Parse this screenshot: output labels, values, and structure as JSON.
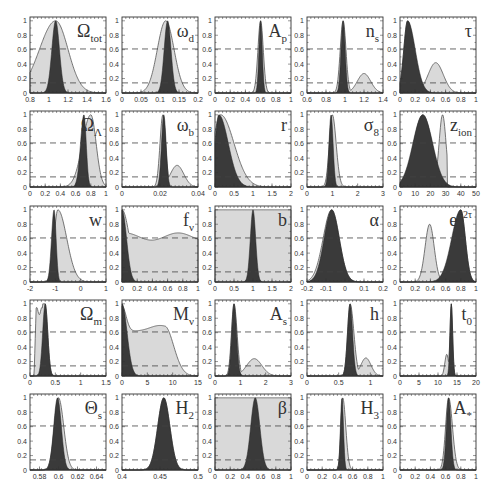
{
  "figure": {
    "type": "grid of 1D marginal likelihood panels",
    "rows": 5,
    "cols": 5,
    "colors": {
      "background": "#ffffff",
      "light_fill": "#d9d9d9",
      "dark_fill": "#3a3a3a",
      "line": "#555555",
      "dashed": "#444444",
      "axis": "#333333"
    },
    "dashed_levels": [
      0.61,
      0.14
    ],
    "yticks": [
      "0",
      "0.2",
      "0.4",
      "0.6",
      "0.8",
      "1"
    ]
  },
  "chart_data": [
    {
      "id": "omega_tot",
      "label": "Ω",
      "sub": "tot",
      "sup": "",
      "xlim": [
        0.5,
        1.6
      ],
      "xticks": [
        {
          "v": 0.5,
          "t": "0.8"
        },
        {
          "v": 0.8,
          "t": "1"
        },
        {
          "v": 1.0,
          "t": "1.2"
        },
        {
          "v": 1.2,
          "t": "1.4"
        },
        {
          "v": 1.4,
          "t": "1.6"
        }
      ],
      "xticks_real": [
        {
          "v": 0.8,
          "t": "0.8"
        },
        {
          "v": 1.0,
          "t": "1"
        },
        {
          "v": 1.2,
          "t": "1.2"
        },
        {
          "v": 1.4,
          "t": "1.4"
        },
        {
          "v": 1.6,
          "t": "1.6"
        }
      ],
      "xlim_real": [
        0.8,
        1.6
      ],
      "light": {
        "peak": 1.07,
        "sl": 0.17,
        "sr": 0.13
      },
      "dark": {
        "peak": 1.07,
        "sl": 0.04,
        "sr": 0.04
      },
      "light_floor_left": 0.32,
      "type": "line"
    },
    {
      "id": "omega_d",
      "label": "ω",
      "sub": "d",
      "sup": "",
      "xlim_real": [
        0,
        0.2
      ],
      "xticks_real": [
        {
          "v": 0,
          "t": "0"
        },
        {
          "v": 0.05,
          "t": "0.05"
        },
        {
          "v": 0.1,
          "t": "0.1"
        },
        {
          "v": 0.15,
          "t": "0.15"
        },
        {
          "v": 0.2,
          "t": "0.2"
        }
      ],
      "light": {
        "peak": 0.115,
        "sl": 0.022,
        "sr": 0.022
      },
      "dark": {
        "peak": 0.12,
        "sl": 0.009,
        "sr": 0.009
      },
      "type": "line"
    },
    {
      "id": "A_p",
      "label": "A",
      "sub": "p",
      "sup": "",
      "xlim_real": [
        0,
        1
      ],
      "xticks_real": [
        {
          "v": 0,
          "t": "0"
        },
        {
          "v": 0.2,
          "t": "0.2"
        },
        {
          "v": 0.4,
          "t": "0.4"
        },
        {
          "v": 0.6,
          "t": "0.6"
        },
        {
          "v": 0.8,
          "t": "0.8"
        },
        {
          "v": 1,
          "t": "1"
        }
      ],
      "light": {
        "peak": 0.6,
        "sl": 0.035,
        "sr": 0.035
      },
      "dark": {
        "peak": 0.6,
        "sl": 0.022,
        "sr": 0.022
      },
      "type": "line"
    },
    {
      "id": "n_s",
      "label": "n",
      "sub": "s",
      "sup": "",
      "xlim_real": [
        0.6,
        1.4
      ],
      "xticks_real": [
        {
          "v": 0.6,
          "t": "0.6"
        },
        {
          "v": 0.8,
          "t": "0.8"
        },
        {
          "v": 1.0,
          "t": "1"
        },
        {
          "v": 1.2,
          "t": "1.2"
        },
        {
          "v": 1.4,
          "t": "1.4"
        }
      ],
      "light": {
        "peak": 0.98,
        "sl": 0.03,
        "sr": 0.03,
        "bump": {
          "c": 1.2,
          "h": 0.27,
          "s": 0.07
        }
      },
      "dark": {
        "peak": 0.98,
        "sl": 0.022,
        "sr": 0.022
      },
      "type": "line"
    },
    {
      "id": "tau",
      "label": "τ",
      "sub": "",
      "sup": "",
      "xlim_real": [
        0,
        1
      ],
      "xticks_real": [
        {
          "v": 0,
          "t": "0"
        },
        {
          "v": 0.2,
          "t": "0.2"
        },
        {
          "v": 0.4,
          "t": "0.4"
        },
        {
          "v": 0.6,
          "t": "0.6"
        },
        {
          "v": 0.8,
          "t": "0.8"
        },
        {
          "v": 1,
          "t": "1"
        }
      ],
      "light": {
        "peak": 0.1,
        "sl": 0.05,
        "sr": 0.08,
        "bump": {
          "c": 0.47,
          "h": 0.42,
          "s": 0.1
        }
      },
      "dark": {
        "peak": 0.1,
        "sl": 0.05,
        "sr": 0.1
      },
      "type": "line"
    },
    {
      "id": "omega_lambda",
      "label": "Ω",
      "sub": "Λ",
      "sup": "",
      "xlim_real": [
        0,
        1
      ],
      "xticks_real": [
        {
          "v": 0,
          "t": "0"
        },
        {
          "v": 0.2,
          "t": "0.2"
        },
        {
          "v": 0.4,
          "t": "0.4"
        },
        {
          "v": 0.6,
          "t": "0.6"
        },
        {
          "v": 0.8,
          "t": "0.8"
        },
        {
          "v": 1,
          "t": "1"
        }
      ],
      "light": {
        "peak": 0.8,
        "sl": 0.11,
        "sr": 0.07
      },
      "dark": {
        "peak": 0.71,
        "sl": 0.045,
        "sr": 0.03
      },
      "type": "line"
    },
    {
      "id": "omega_b",
      "label": "ω",
      "sub": "b",
      "sup": "",
      "xlim_real": [
        0,
        0.04
      ],
      "xticks_real": [
        {
          "v": 0,
          "t": "0"
        },
        {
          "v": 0.02,
          "t": "0.02"
        },
        {
          "v": 0.04,
          "t": "0.04"
        }
      ],
      "light": {
        "peak": 0.0215,
        "sl": 0.0015,
        "sr": 0.0015,
        "bump": {
          "c": 0.029,
          "h": 0.3,
          "s": 0.0035
        }
      },
      "dark": {
        "peak": 0.022,
        "sl": 0.0012,
        "sr": 0.0012
      },
      "type": "line"
    },
    {
      "id": "r",
      "label": "r",
      "sub": "",
      "sup": "",
      "xlim_real": [
        0,
        2
      ],
      "xticks_real": [
        {
          "v": 0,
          "t": "0"
        },
        {
          "v": 0.5,
          "t": "0.5"
        },
        {
          "v": 1,
          "t": "1"
        },
        {
          "v": 1.5,
          "t": "1.5"
        },
        {
          "v": 2,
          "t": "2"
        }
      ],
      "light": {
        "peak": 0.15,
        "sl": 0.2,
        "sr": 0.35
      },
      "dark": {
        "peak": 0.1,
        "sl": 0.1,
        "sr": 0.25
      },
      "type": "line"
    },
    {
      "id": "sigma_8",
      "label": "σ",
      "sub": "8",
      "sup": "",
      "xlim_real": [
        0,
        3
      ],
      "xticks_real": [
        {
          "v": 0,
          "t": "0"
        },
        {
          "v": 1,
          "t": "1"
        },
        {
          "v": 2,
          "t": "2"
        },
        {
          "v": 3,
          "t": "3"
        }
      ],
      "light": {
        "peak": 1.0,
        "sl": 0.12,
        "sr": 0.15
      },
      "dark": {
        "peak": 0.95,
        "sl": 0.08,
        "sr": 0.08
      },
      "type": "line"
    },
    {
      "id": "z_ion",
      "label": "z",
      "sub": "ion",
      "sup": "",
      "xlim_real": [
        0,
        50
      ],
      "xticks_real": [
        {
          "v": 0,
          "t": "0"
        },
        {
          "v": 10,
          "t": "10"
        },
        {
          "v": 20,
          "t": "20"
        },
        {
          "v": 30,
          "t": "30"
        },
        {
          "v": 40,
          "t": "40"
        },
        {
          "v": 50,
          "t": "50"
        }
      ],
      "light": {
        "peak": 15,
        "sl": 6,
        "sr": 6,
        "bump": {
          "c": 28,
          "h": 1.0,
          "s": 2.3
        },
        "cut": 31
      },
      "dark": {
        "peak": 15,
        "sl": 6.5,
        "sr": 6.5
      },
      "type": "line"
    },
    {
      "id": "w",
      "label": "w",
      "sub": "",
      "sup": "",
      "xlim_real": [
        -2,
        1
      ],
      "xticks_real": [
        {
          "v": -2,
          "t": "-2"
        },
        {
          "v": -1,
          "t": "-1"
        },
        {
          "v": 0,
          "t": "0"
        },
        {
          "v": 1,
          "t": "1"
        }
      ],
      "light": {
        "peak": -0.9,
        "sl": 0.15,
        "sr": 0.35
      },
      "dark": {
        "peak": -1.05,
        "sl": 0.1,
        "sr": 0.08
      },
      "type": "line"
    },
    {
      "id": "f_nu",
      "label": "f",
      "sub": "ν",
      "sup": "",
      "xlim_real": [
        0,
        1
      ],
      "xticks_real": [
        {
          "v": 0,
          "t": "0"
        },
        {
          "v": 0.2,
          "t": "0.2"
        },
        {
          "v": 0.4,
          "t": "0.4"
        },
        {
          "v": 0.6,
          "t": "0.6"
        },
        {
          "v": 0.8,
          "t": "0.8"
        },
        {
          "v": 1,
          "t": "1"
        }
      ],
      "light": {
        "custom": "fnu"
      },
      "dark": {
        "peak": 0.0,
        "sl": 0.01,
        "sr": 0.06
      },
      "type": "line"
    },
    {
      "id": "b",
      "label": "b",
      "sub": "",
      "sup": "",
      "xlim_real": [
        0,
        2
      ],
      "xticks_real": [
        {
          "v": 0,
          "t": "0"
        },
        {
          "v": 0.5,
          "t": "0.5"
        },
        {
          "v": 1,
          "t": "1"
        },
        {
          "v": 1.5,
          "t": "1.5"
        },
        {
          "v": 2,
          "t": "2"
        }
      ],
      "light": {
        "custom": "flat"
      },
      "dark": {
        "peak": 1.0,
        "sl": 0.07,
        "sr": 0.07
      },
      "type": "line"
    },
    {
      "id": "alpha",
      "label": "α",
      "sub": "",
      "sup": "",
      "xlim_real": [
        -0.2,
        0.2
      ],
      "xticks_real": [
        {
          "v": -0.2,
          "t": "-0.2"
        },
        {
          "v": -0.1,
          "t": "-0.1"
        },
        {
          "v": 0,
          "t": "0"
        },
        {
          "v": 0.1,
          "t": "0.1"
        },
        {
          "v": 0.2,
          "t": "0.2"
        }
      ],
      "light": {
        "peak": -0.07,
        "sl": 0.045,
        "sr": 0.04
      },
      "dark": {
        "peak": -0.07,
        "sl": 0.04,
        "sr": 0.04
      },
      "type": "line"
    },
    {
      "id": "e_2tau",
      "label": "e",
      "sub": "",
      "sup": "−2τ",
      "xlim_real": [
        0,
        1
      ],
      "xticks_real": [
        {
          "v": 0,
          "t": "0"
        },
        {
          "v": 0.2,
          "t": "0.2"
        },
        {
          "v": 0.4,
          "t": "0.4"
        },
        {
          "v": 0.6,
          "t": "0.6"
        },
        {
          "v": 0.8,
          "t": "0.8"
        },
        {
          "v": 1,
          "t": "1"
        }
      ],
      "light": {
        "peak": 0.8,
        "sl": 0.09,
        "sr": 0.06,
        "bump": {
          "c": 0.39,
          "h": 0.8,
          "s": 0.06
        }
      },
      "dark": {
        "peak": 0.8,
        "sl": 0.12,
        "sr": 0.06
      },
      "type": "line"
    },
    {
      "id": "omega_m",
      "label": "Ω",
      "sub": "m",
      "sup": "",
      "xlim_real": [
        0,
        1.5
      ],
      "xticks_real": [
        {
          "v": 0,
          "t": "0"
        },
        {
          "v": 0.5,
          "t": "0.5"
        },
        {
          "v": 1,
          "t": "1"
        },
        {
          "v": 1.5,
          "t": "1.5"
        }
      ],
      "light": {
        "custom": "omegam"
      },
      "dark": {
        "peak": 0.3,
        "sl": 0.05,
        "sr": 0.05
      },
      "type": "line"
    },
    {
      "id": "M_nu",
      "label": "M",
      "sub": "ν",
      "sup": "",
      "xlim_real": [
        0,
        15
      ],
      "xticks_real": [
        {
          "v": 0,
          "t": "0"
        },
        {
          "v": 5,
          "t": "5"
        },
        {
          "v": 10,
          "t": "10"
        },
        {
          "v": 15,
          "t": "15"
        }
      ],
      "light": {
        "custom": "mnu"
      },
      "dark": {
        "peak": 0,
        "sl": 0.1,
        "sr": 1.0
      },
      "type": "line"
    },
    {
      "id": "A_s",
      "label": "A",
      "sub": "s",
      "sup": "",
      "xlim_real": [
        0,
        3
      ],
      "xticks_real": [
        {
          "v": 0,
          "t": "0"
        },
        {
          "v": 1,
          "t": "1"
        },
        {
          "v": 2,
          "t": "2"
        },
        {
          "v": 3,
          "t": "3"
        }
      ],
      "light": {
        "peak": 0.75,
        "sl": 0.1,
        "sr": 0.12,
        "bump": {
          "c": 1.55,
          "h": 0.24,
          "s": 0.3
        }
      },
      "dark": {
        "peak": 0.75,
        "sl": 0.09,
        "sr": 0.1
      },
      "type": "line"
    },
    {
      "id": "h",
      "label": "h",
      "sub": "",
      "sup": "",
      "xlim_real": [
        0,
        1.2
      ],
      "xticks_real": [
        {
          "v": 0,
          "t": "0"
        },
        {
          "v": 0.5,
          "t": "0.5"
        },
        {
          "v": 1,
          "t": "1"
        }
      ],
      "light": {
        "peak": 0.68,
        "sl": 0.04,
        "sr": 0.06,
        "bump": {
          "c": 0.93,
          "h": 0.25,
          "s": 0.08
        }
      },
      "dark": {
        "peak": 0.68,
        "sl": 0.04,
        "sr": 0.04
      },
      "type": "line"
    },
    {
      "id": "t_0",
      "label": "t",
      "sub": "0",
      "sup": "",
      "xlim_real": [
        0,
        20
      ],
      "xticks_real": [
        {
          "v": 0,
          "t": "0"
        },
        {
          "v": 5,
          "t": "5"
        },
        {
          "v": 10,
          "t": "10"
        },
        {
          "v": 15,
          "t": "15"
        },
        {
          "v": 20,
          "t": "20"
        }
      ],
      "light": {
        "peak": 13.5,
        "sl": 0.35,
        "sr": 0.35,
        "bump": {
          "c": 12.3,
          "h": 0.3,
          "s": 0.5
        }
      },
      "dark": {
        "peak": 13.5,
        "sl": 0.35,
        "sr": 0.35
      },
      "type": "line"
    },
    {
      "id": "theta_s",
      "label": "Θ",
      "sub": "s",
      "sup": "",
      "xlim_real": [
        0.57,
        0.65
      ],
      "xticks_real": [
        {
          "v": 0.58,
          "t": "0.58"
        },
        {
          "v": 0.6,
          "t": "0.6"
        },
        {
          "v": 0.62,
          "t": "0.62"
        },
        {
          "v": 0.64,
          "t": "0.64"
        }
      ],
      "light": {
        "peak": 0.6,
        "sl": 0.0045,
        "sr": 0.0055
      },
      "dark": {
        "peak": 0.599,
        "sl": 0.004,
        "sr": 0.004
      },
      "type": "line"
    },
    {
      "id": "H_2",
      "label": "H",
      "sub": "2",
      "sup": "",
      "xlim_real": [
        0.4,
        0.5
      ],
      "xticks_real": [
        {
          "v": 0.4,
          "t": "0.4"
        },
        {
          "v": 0.45,
          "t": "0.45"
        },
        {
          "v": 0.5,
          "t": "0.5"
        }
      ],
      "light": {
        "peak": 0.455,
        "sl": 0.008,
        "sr": 0.008
      },
      "dark": {
        "peak": 0.455,
        "sl": 0.008,
        "sr": 0.008
      },
      "type": "line"
    },
    {
      "id": "beta",
      "label": "β",
      "sub": "",
      "sup": "",
      "xlim_real": [
        0,
        1
      ],
      "xticks_real": [
        {
          "v": 0,
          "t": "0"
        },
        {
          "v": 0.2,
          "t": "0.2"
        },
        {
          "v": 0.4,
          "t": "0.4"
        },
        {
          "v": 0.6,
          "t": "0.6"
        },
        {
          "v": 0.8,
          "t": "0.8"
        },
        {
          "v": 1,
          "t": "1"
        }
      ],
      "light": {
        "custom": "flat"
      },
      "dark": {
        "peak": 0.53,
        "sl": 0.06,
        "sr": 0.06
      },
      "type": "line"
    },
    {
      "id": "H_3",
      "label": "H",
      "sub": "3",
      "sup": "",
      "xlim_real": [
        0,
        1
      ],
      "xticks_real": [
        {
          "v": 0,
          "t": "0"
        },
        {
          "v": 0.2,
          "t": "0.2"
        },
        {
          "v": 0.4,
          "t": "0.4"
        },
        {
          "v": 0.6,
          "t": "0.6"
        },
        {
          "v": 0.8,
          "t": "0.8"
        },
        {
          "v": 1,
          "t": "1"
        }
      ],
      "light": {
        "peak": 0.47,
        "sl": 0.025,
        "sr": 0.04
      },
      "dark": {
        "peak": 0.46,
        "sl": 0.02,
        "sr": 0.02
      },
      "type": "line"
    },
    {
      "id": "A_star",
      "label": "A",
      "sub": "*",
      "sup": "",
      "xlim_real": [
        0,
        1
      ],
      "xticks_real": [
        {
          "v": 0,
          "t": "0"
        },
        {
          "v": 0.2,
          "t": "0.2"
        },
        {
          "v": 0.4,
          "t": "0.4"
        },
        {
          "v": 0.6,
          "t": "0.6"
        },
        {
          "v": 0.8,
          "t": "0.8"
        },
        {
          "v": 1,
          "t": "1"
        }
      ],
      "light": {
        "peak": 0.64,
        "sl": 0.04,
        "sr": 0.05
      },
      "dark": {
        "peak": 0.64,
        "sl": 0.03,
        "sr": 0.03
      },
      "type": "line"
    }
  ]
}
